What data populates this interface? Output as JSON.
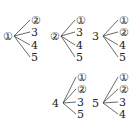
{
  "trees": [
    {
      "root": "①",
      "root_circled": true,
      "leaves": [
        {
          "label": "②",
          "circled": true
        },
        {
          "label": "3",
          "circled": false
        },
        {
          "label": "4",
          "circled": false
        },
        {
          "label": "5",
          "circled": false
        }
      ],
      "rx": 8,
      "ry": 36,
      "lx": 32,
      "ly": [
        20,
        32,
        45,
        57
      ]
    },
    {
      "root": "②",
      "root_circled": true,
      "leaves": [
        {
          "label": "①",
          "circled": true
        },
        {
          "label": "3",
          "circled": false
        },
        {
          "label": "4",
          "circled": false
        },
        {
          "label": "5",
          "circled": false
        }
      ],
      "rx": 55,
      "ry": 36,
      "lx": 77,
      "ly": [
        20,
        32,
        45,
        57
      ]
    },
    {
      "root": "3",
      "root_circled": false,
      "leaves": [
        {
          "label": "①",
          "circled": true
        },
        {
          "label": "②",
          "circled": true
        },
        {
          "label": "4",
          "circled": false
        },
        {
          "label": "5",
          "circled": false
        }
      ],
      "rx": 97,
      "ry": 36,
      "lx": 120,
      "ly": [
        20,
        32,
        45,
        57
      ]
    },
    {
      "root": "4",
      "root_circled": false,
      "leaves": [
        {
          "label": "①",
          "circled": true
        },
        {
          "label": "②",
          "circled": true
        },
        {
          "label": "3",
          "circled": false
        },
        {
          "label": "5",
          "circled": false
        }
      ],
      "rx": 57,
      "ry": 103,
      "lx": 78,
      "ly": [
        77,
        89,
        102,
        114
      ]
    },
    {
      "root": "5",
      "root_circled": false,
      "leaves": [
        {
          "label": "①",
          "circled": true
        },
        {
          "label": "②",
          "circled": true
        },
        {
          "label": "3",
          "circled": false
        },
        {
          "label": "4",
          "circled": false
        }
      ],
      "rx": 97,
      "ry": 103,
      "lx": 120,
      "ly": [
        77,
        89,
        102,
        114
      ]
    }
  ]
}
